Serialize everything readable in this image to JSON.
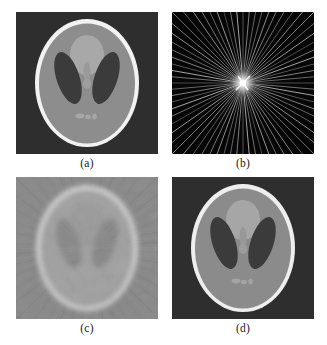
{
  "figure": {
    "background_color": "#ffffff",
    "width": 327,
    "height": 345,
    "layout": "2x2 grid of square grayscale image panels with lettered captions"
  },
  "panels": [
    {
      "id": "a",
      "caption": "(a)",
      "kind": "phantom",
      "description": "Shepp-Logan head phantom, original image",
      "background_color": "#2f2f2f",
      "skull_color": "#f2f2f2",
      "body_color": "#8d8d8d",
      "blob_color": "#a8a8a8",
      "ventricle_color": "#3a3a3a",
      "noise": "low"
    },
    {
      "id": "b",
      "caption": "(b)",
      "kind": "radial-star",
      "description": "Radial sampling pattern / sinogram star with bright centre",
      "background_color": "#050505",
      "ray_color": "#e8e8e8",
      "center_color": "#ffffff",
      "ray_count": 36,
      "center_x": 0.5,
      "center_y": 0.5
    },
    {
      "id": "c",
      "caption": "(c)",
      "kind": "blurred-reconstruction",
      "description": "Low quality reconstruction with streak artefacts and low contrast",
      "background_color": "#8a8a8a",
      "skull_color": "#d8d8d8",
      "body_color": "#a0a0a0",
      "blob_color": "#9a9a9a",
      "ventricle_color": "#868686",
      "noise": "high streak artefacts"
    },
    {
      "id": "d",
      "caption": "(d)",
      "kind": "phantom",
      "description": "High quality reconstruction, nearly identical to the original phantom",
      "background_color": "#2f2f2f",
      "skull_color": "#eeeeee",
      "body_color": "#8b8b8b",
      "blob_color": "#a6a6a6",
      "ventricle_color": "#3b3b3b",
      "noise": "low"
    }
  ],
  "chart_data": {
    "type": "heatmap",
    "xlabel": "",
    "ylabel": "",
    "grid": false,
    "legend": "none",
    "panel_labels": [
      "(a)",
      "(b)",
      "(c)",
      "(d)"
    ],
    "panel_contents": [
      "Original Shepp-Logan phantom",
      "Radial star sampling pattern (36 rays)",
      "Blurred reconstruction with streaks",
      "Accurate reconstruction"
    ],
    "grayscale_levels": {
      "background": 47,
      "body": 141,
      "skull": 242,
      "blob": 168,
      "ventricle": 58
    }
  }
}
